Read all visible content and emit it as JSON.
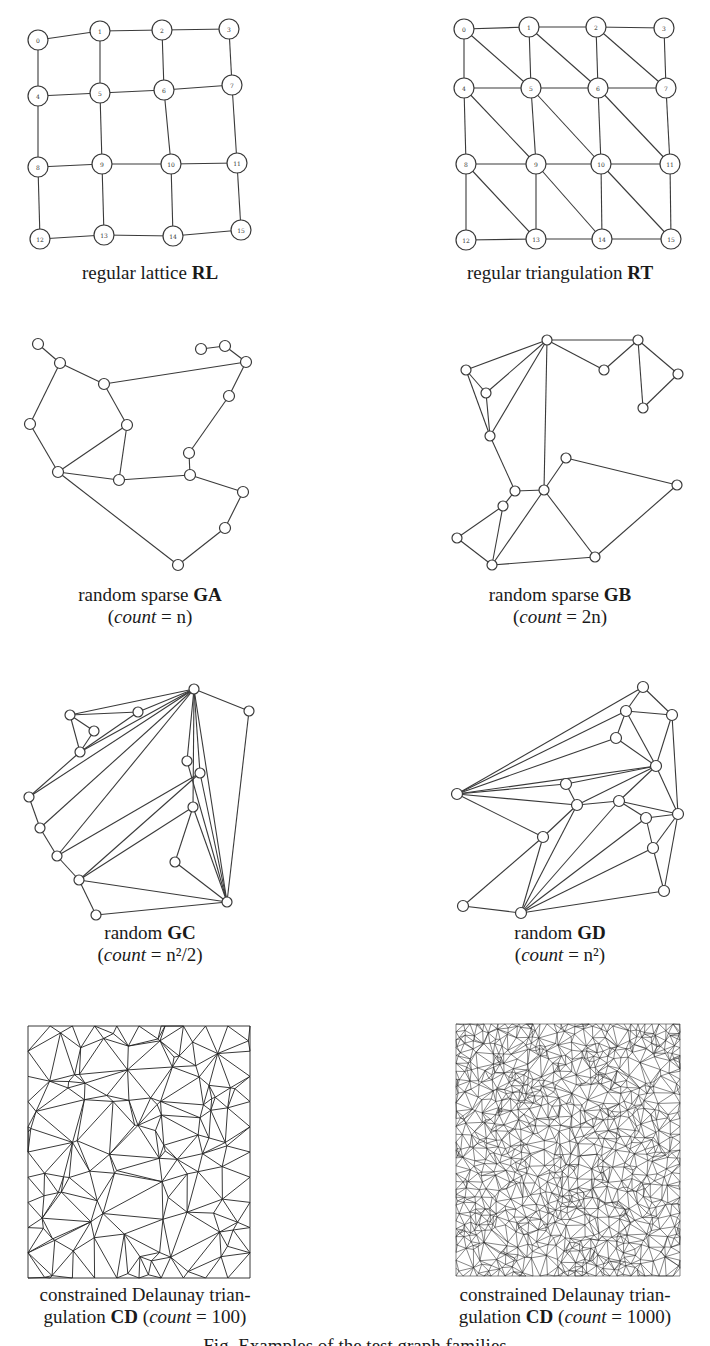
{
  "figure": {
    "panels": [
      {
        "id": "RL",
        "caption_line1": "regular lattice ",
        "caption_bold": "RL",
        "caption_line2": ""
      },
      {
        "id": "RT",
        "caption_line1": "regular triangulation ",
        "caption_bold": "RT",
        "caption_line2": ""
      },
      {
        "id": "GA",
        "caption_line1": "random sparse ",
        "caption_bold": "GA",
        "caption_line2_prefix": "(",
        "caption_line2_italic": "count",
        "caption_line2_suffix": " = n)"
      },
      {
        "id": "GB",
        "caption_line1": "random sparse ",
        "caption_bold": "GB",
        "caption_line2_prefix": "(",
        "caption_line2_italic": "count",
        "caption_line2_suffix": " = 2n)"
      },
      {
        "id": "GC",
        "caption_line1": "random ",
        "caption_bold": "GC",
        "caption_line2_prefix": "(",
        "caption_line2_italic": "count",
        "caption_line2_suffix": " = n²/2)"
      },
      {
        "id": "GD",
        "caption_line1": "random ",
        "caption_bold": "GD",
        "caption_line2_prefix": "(",
        "caption_line2_italic": "count",
        "caption_line2_suffix": " = n²)"
      },
      {
        "id": "CD100",
        "caption_line1": "constrained Delaunay trian-",
        "caption_line2_prefix": "gulation ",
        "caption_bold": "CD",
        "caption_line2_mid": " (",
        "caption_line2_italic": "count",
        "caption_line2_suffix": " = 100)"
      },
      {
        "id": "CD1000",
        "caption_line1": "constrained Delaunay trian-",
        "caption_line2_prefix": "gulation ",
        "caption_bold": "CD",
        "caption_line2_mid": " (",
        "caption_line2_italic": "count",
        "caption_line2_suffix": " = 1000)"
      }
    ],
    "lattice_labels": [
      "0",
      "1",
      "2",
      "3",
      "4",
      "5",
      "6",
      "7",
      "8",
      "9",
      "10",
      "11",
      "12",
      "13",
      "14",
      "15"
    ],
    "figure_caption": "Fig. Examples of the test graph families"
  }
}
